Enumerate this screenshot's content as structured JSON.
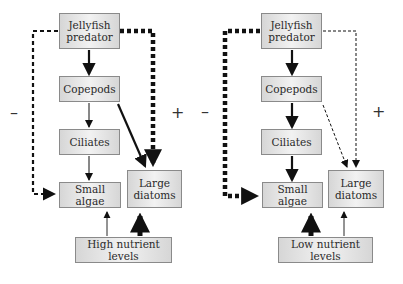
{
  "diagrams": [
    {
      "id": "high",
      "nodes": {
        "jellyfish": "Jellyfish\npredator",
        "copepods": "Copepods",
        "ciliates": "Ciliates",
        "small_algae": "Small algae",
        "large_diatoms": "Large\ndiatoms",
        "nutrients": "High nutrient levels"
      },
      "signs": {
        "left": "–",
        "right": "+"
      },
      "links": [
        {
          "from": "Jellyfish predator",
          "to": "Copepods",
          "style": "solid",
          "weight": "thick"
        },
        {
          "from": "Copepods",
          "to": "Ciliates",
          "style": "solid",
          "weight": "thin"
        },
        {
          "from": "Ciliates",
          "to": "Small algae",
          "style": "solid",
          "weight": "thin"
        },
        {
          "from": "Copepods",
          "to": "Large diatoms",
          "style": "solid",
          "weight": "thick"
        },
        {
          "from": "Jellyfish predator",
          "to": "Small algae",
          "style": "dashed",
          "weight": "medium",
          "sign": "–"
        },
        {
          "from": "Jellyfish predator",
          "to": "Large diatoms",
          "style": "dashed",
          "weight": "very thick",
          "sign": "+"
        },
        {
          "from": "High nutrient levels",
          "to": "Small algae",
          "style": "solid",
          "weight": "thin"
        },
        {
          "from": "High nutrient levels",
          "to": "Large diatoms",
          "style": "solid",
          "weight": "very thick"
        }
      ]
    },
    {
      "id": "low",
      "nodes": {
        "jellyfish": "Jellyfish\npredator",
        "copepods": "Copepods",
        "ciliates": "Ciliates",
        "small_algae": "Small algae",
        "large_diatoms": "Large\ndiatoms",
        "nutrients": "Low nutrient levels"
      },
      "signs": {
        "left": "–",
        "right": "+"
      },
      "links": [
        {
          "from": "Jellyfish predator",
          "to": "Copepods",
          "style": "solid",
          "weight": "thick"
        },
        {
          "from": "Copepods",
          "to": "Ciliates",
          "style": "solid",
          "weight": "thick"
        },
        {
          "from": "Ciliates",
          "to": "Small algae",
          "style": "solid",
          "weight": "thick"
        },
        {
          "from": "Copepods",
          "to": "Large diatoms",
          "style": "dashed",
          "weight": "thin"
        },
        {
          "from": "Jellyfish predator",
          "to": "Small algae",
          "style": "dashed",
          "weight": "very thick",
          "sign": "–"
        },
        {
          "from": "Jellyfish predator",
          "to": "Large diatoms",
          "style": "dashed",
          "weight": "thin",
          "sign": "+"
        },
        {
          "from": "Low nutrient levels",
          "to": "Small algae",
          "style": "solid",
          "weight": "very thick"
        },
        {
          "from": "Low nutrient levels",
          "to": "Large diatoms",
          "style": "solid",
          "weight": "thin"
        }
      ]
    }
  ]
}
